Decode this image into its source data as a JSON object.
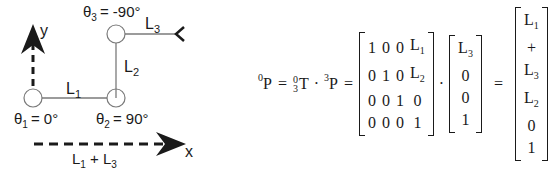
{
  "diagram": {
    "axes": {
      "x_label": "x",
      "y_label": "y"
    },
    "joints": [
      {
        "name": "θ",
        "index": "1",
        "value": "= 0°"
      },
      {
        "name": "θ",
        "index": "2",
        "value": "= 90°"
      },
      {
        "name": "θ",
        "index": "3",
        "value": "= -90°"
      }
    ],
    "links": [
      {
        "name": "L",
        "index": "1"
      },
      {
        "name": "L",
        "index": "2"
      },
      {
        "name": "L",
        "index": "3"
      }
    ],
    "reach_label": {
      "a": "L",
      "a_idx": "1",
      "plus": " + ",
      "b": "L",
      "b_idx": "3"
    },
    "colors": {
      "line": "#7a7a7a",
      "text": "#1a1a1a",
      "arrow": "#1a1a1a"
    }
  },
  "equation": {
    "lhs": {
      "pre_sup": "0",
      "symbol": "P"
    },
    "eq1": "=",
    "transform": {
      "top": "0",
      "bottom": "3",
      "symbol": "T"
    },
    "dot": "·",
    "point": {
      "pre_sup": "3",
      "symbol": "P"
    },
    "eq2": "=",
    "matrix": [
      [
        "1",
        "0",
        "0",
        "L1"
      ],
      [
        "0",
        "1",
        "0",
        "L2"
      ],
      [
        "0",
        "0",
        "1",
        "0"
      ],
      [
        "0",
        "0",
        "0",
        "1"
      ]
    ],
    "vector_in": [
      "L3",
      "0",
      "0",
      "1"
    ],
    "eq3": "=",
    "vector_out": [
      "L1 + L3",
      "L2",
      "0",
      "1"
    ]
  }
}
